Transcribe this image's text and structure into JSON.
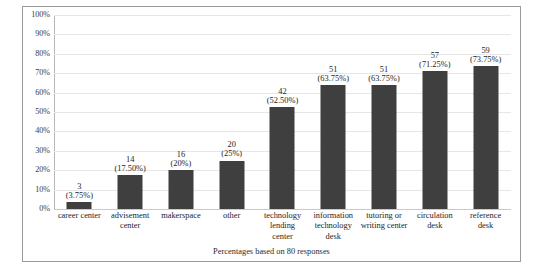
{
  "figure": {
    "caption": "Percentages based on 80 responses",
    "border_color": "#9a9a9a",
    "background": "#ffffff"
  },
  "chart_data": {
    "type": "bar",
    "title": "",
    "subtitle": "",
    "xlabel": "",
    "ylabel": "",
    "ylim": [
      0,
      100
    ],
    "y_unit": "percent",
    "grid": true,
    "legend": false,
    "orientation": "vertical",
    "bar_color": "#3f3f3f",
    "gridline_color": "#e6e6e6",
    "total_responses": 80,
    "annotation": "Percentages based on 80 responses",
    "y_ticks": [
      "0%",
      "10%",
      "20%",
      "30%",
      "40%",
      "50%",
      "60%",
      "70%",
      "80%",
      "90%",
      "100%"
    ],
    "y_tick_values": [
      0,
      10,
      20,
      30,
      40,
      50,
      60,
      70,
      80,
      90,
      100
    ],
    "categories": [
      "career center",
      "advisement center",
      "makerspace",
      "other",
      "technology lending center",
      "information technology desk",
      "tutoring or writing center",
      "circulation desk",
      "reference desk"
    ],
    "values": [
      3.75,
      17.5,
      20,
      25,
      52.5,
      63.75,
      63.75,
      71.25,
      73.75
    ],
    "counts": [
      3,
      14,
      16,
      20,
      42,
      51,
      51,
      57,
      59
    ],
    "data_labels": [
      {
        "count": "3",
        "pct": "(3.75%)"
      },
      {
        "count": "14",
        "pct": "(17.50%)"
      },
      {
        "count": "16",
        "pct": "(20%)"
      },
      {
        "count": "20",
        "pct": "(25%)"
      },
      {
        "count": "42",
        "pct": "(52.50%)"
      },
      {
        "count": "51",
        "pct": "(63.75%)"
      },
      {
        "count": "51",
        "pct": "(63.75%)"
      },
      {
        "count": "57",
        "pct": "(71.25%)"
      },
      {
        "count": "59",
        "pct": "(73.75%)"
      }
    ],
    "category_lines": [
      [
        "career center"
      ],
      [
        "advisement",
        "center"
      ],
      [
        "makerspace"
      ],
      [
        "other"
      ],
      [
        "technology",
        "lending",
        "center"
      ],
      [
        "information",
        "technology",
        "desk"
      ],
      [
        "tutoring or",
        "writing center"
      ],
      [
        "circulation",
        "desk"
      ],
      [
        "reference",
        "desk"
      ]
    ]
  }
}
